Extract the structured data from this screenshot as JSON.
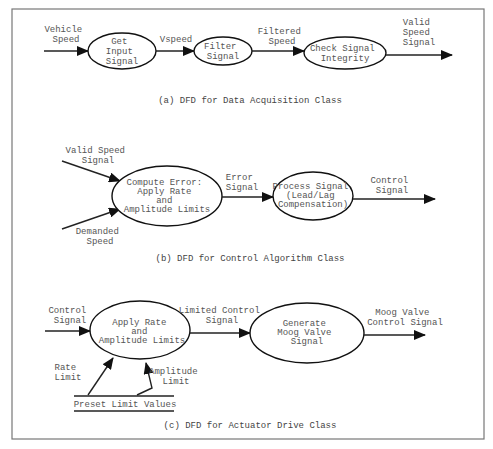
{
  "figure": {
    "diagrams": [
      {
        "id": "a",
        "caption": "(a) DFD for Data Acquisition Class",
        "processes": [
          {
            "lines": [
              "Get",
              "Input",
              "Signal"
            ]
          },
          {
            "lines": [
              "Filter",
              "Signal"
            ]
          },
          {
            "lines": [
              "Check Signal",
              "Integrity"
            ]
          }
        ],
        "flows": [
          {
            "lines": [
              "Vehicle",
              "Speed"
            ]
          },
          {
            "lines": [
              "Vspeed"
            ]
          },
          {
            "lines": [
              "Filtered",
              "Speed"
            ]
          },
          {
            "lines": [
              "Valid",
              "Speed",
              "Signal"
            ]
          }
        ]
      },
      {
        "id": "b",
        "caption": "(b) DFD for Control Algorithm Class",
        "processes": [
          {
            "lines": [
              "Compute Error:",
              "Apply Rate",
              "and",
              "Amplitude Limits"
            ]
          },
          {
            "lines": [
              "Process Signal",
              "(Lead/Lag",
              "Compensation)"
            ]
          }
        ],
        "flows": [
          {
            "lines": [
              "Valid Speed",
              "Signal"
            ]
          },
          {
            "lines": [
              "Demanded",
              "Speed"
            ]
          },
          {
            "lines": [
              "Error",
              "Signal"
            ]
          },
          {
            "lines": [
              "Control",
              "Signal"
            ]
          }
        ]
      },
      {
        "id": "c",
        "caption": "(c) DFD for Actuator Drive Class",
        "processes": [
          {
            "lines": [
              "Apply Rate",
              "and",
              "Amplitude Limits"
            ]
          },
          {
            "lines": [
              "Generate",
              "Moog Valve",
              "Signal"
            ]
          }
        ],
        "flows": [
          {
            "lines": [
              "Control",
              "Signal"
            ]
          },
          {
            "lines": [
              "Limited Control",
              "Signal"
            ]
          },
          {
            "lines": [
              "Moog Valve",
              "Control Signal"
            ]
          },
          {
            "lines": [
              "Rate",
              "Limit"
            ]
          },
          {
            "lines": [
              "Amplitude",
              "Limit"
            ]
          }
        ],
        "data_store": {
          "label": "Preset Limit Values"
        }
      }
    ]
  }
}
